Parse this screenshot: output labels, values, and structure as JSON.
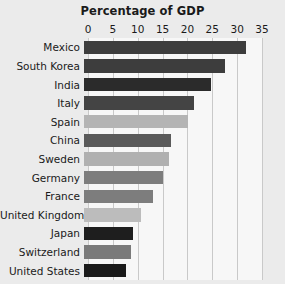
{
  "chart_data": {
    "type": "bar",
    "orientation": "horizontal",
    "title": "Percentage of GDP",
    "xlabel": "",
    "ylabel": "",
    "xlim": [
      0,
      35
    ],
    "xticks": [
      0,
      5,
      10,
      15,
      20,
      25,
      30,
      35
    ],
    "grid": true,
    "legend": null,
    "categories": [
      "Mexico",
      "South Korea",
      "India",
      "Italy",
      "Spain",
      "China",
      "Sweden",
      "Germany",
      "France",
      "United Kingdom",
      "Japan",
      "Switzerland",
      "United States"
    ],
    "values": [
      32.6,
      28.4,
      25.5,
      22.1,
      21.0,
      17.5,
      17.1,
      15.9,
      13.9,
      11.5,
      9.9,
      9.5,
      8.5
    ],
    "bar_colors": [
      "#3d3d3d",
      "#3d3d3d",
      "#2b2b2b",
      "#444444",
      "#b4b4b4",
      "#5a5a5a",
      "#b0b0b0",
      "#7d7d7d",
      "#7d7d7d",
      "#bcbcbc",
      "#1e1e1e",
      "#7a7a7a",
      "#1a1a1a"
    ]
  },
  "colors": {
    "background": "#ebebeb",
    "plot_background": "#f7f7f7",
    "gridline": "#c9c9c9",
    "text": "#1a1a1a"
  }
}
